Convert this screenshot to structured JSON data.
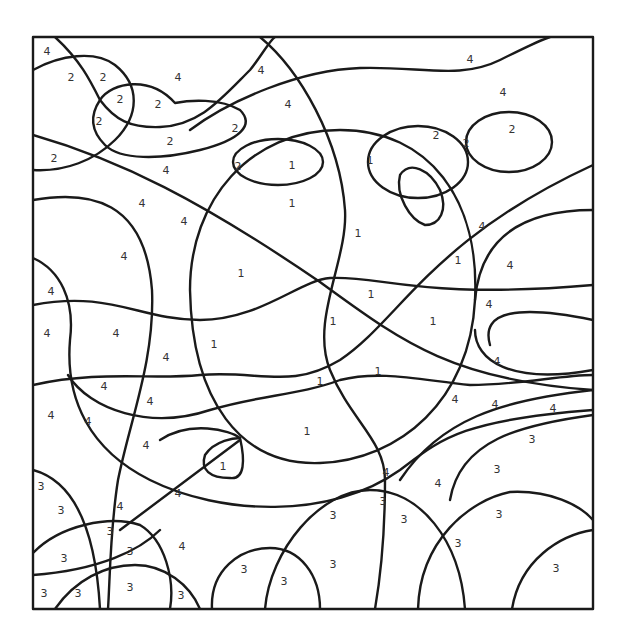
{
  "frame": {
    "x": 33,
    "y": 37,
    "width": 560,
    "height": 572
  },
  "colors": {
    "line": "#1a1a1a",
    "background": "#ffffff",
    "number": "#333333"
  },
  "region_numbers": [
    {
      "n": "4",
      "x": 47,
      "y": 52
    },
    {
      "n": "2",
      "x": 71,
      "y": 78
    },
    {
      "n": "2",
      "x": 103,
      "y": 78
    },
    {
      "n": "4",
      "x": 178,
      "y": 78
    },
    {
      "n": "4",
      "x": 261,
      "y": 71
    },
    {
      "n": "4",
      "x": 470,
      "y": 60
    },
    {
      "n": "2",
      "x": 120,
      "y": 100
    },
    {
      "n": "2",
      "x": 158,
      "y": 105
    },
    {
      "n": "2",
      "x": 99,
      "y": 122
    },
    {
      "n": "4",
      "x": 288,
      "y": 105
    },
    {
      "n": "4",
      "x": 503,
      "y": 93
    },
    {
      "n": "2",
      "x": 235,
      "y": 129
    },
    {
      "n": "2",
      "x": 170,
      "y": 142
    },
    {
      "n": "2",
      "x": 436,
      "y": 136
    },
    {
      "n": "2",
      "x": 466,
      "y": 144
    },
    {
      "n": "2",
      "x": 512,
      "y": 130
    },
    {
      "n": "2",
      "x": 54,
      "y": 159
    },
    {
      "n": "2",
      "x": 238,
      "y": 167
    },
    {
      "n": "1",
      "x": 292,
      "y": 166
    },
    {
      "n": "1",
      "x": 370,
      "y": 161
    },
    {
      "n": "4",
      "x": 166,
      "y": 171
    },
    {
      "n": "1",
      "x": 292,
      "y": 204
    },
    {
      "n": "4",
      "x": 142,
      "y": 204
    },
    {
      "n": "4",
      "x": 184,
      "y": 222
    },
    {
      "n": "1",
      "x": 358,
      "y": 234
    },
    {
      "n": "4",
      "x": 482,
      "y": 227
    },
    {
      "n": "4",
      "x": 124,
      "y": 257
    },
    {
      "n": "1",
      "x": 458,
      "y": 261
    },
    {
      "n": "4",
      "x": 510,
      "y": 266
    },
    {
      "n": "1",
      "x": 241,
      "y": 274
    },
    {
      "n": "4",
      "x": 51,
      "y": 292
    },
    {
      "n": "1",
      "x": 371,
      "y": 295
    },
    {
      "n": "4",
      "x": 489,
      "y": 305
    },
    {
      "n": "4",
      "x": 47,
      "y": 334
    },
    {
      "n": "4",
      "x": 116,
      "y": 334
    },
    {
      "n": "1",
      "x": 333,
      "y": 322
    },
    {
      "n": "1",
      "x": 433,
      "y": 322
    },
    {
      "n": "1",
      "x": 214,
      "y": 345
    },
    {
      "n": "4",
      "x": 166,
      "y": 358
    },
    {
      "n": "4",
      "x": 497,
      "y": 362
    },
    {
      "n": "1",
      "x": 378,
      "y": 372
    },
    {
      "n": "1",
      "x": 320,
      "y": 382
    },
    {
      "n": "4",
      "x": 104,
      "y": 387
    },
    {
      "n": "4",
      "x": 150,
      "y": 402
    },
    {
      "n": "4",
      "x": 455,
      "y": 400
    },
    {
      "n": "4",
      "x": 495,
      "y": 405
    },
    {
      "n": "4",
      "x": 553,
      "y": 409
    },
    {
      "n": "4",
      "x": 51,
      "y": 416
    },
    {
      "n": "4",
      "x": 88,
      "y": 422
    },
    {
      "n": "1",
      "x": 307,
      "y": 432
    },
    {
      "n": "3",
      "x": 532,
      "y": 440
    },
    {
      "n": "4",
      "x": 146,
      "y": 446
    },
    {
      "n": "1",
      "x": 223,
      "y": 467
    },
    {
      "n": "3",
      "x": 497,
      "y": 470
    },
    {
      "n": "4",
      "x": 386,
      "y": 473
    },
    {
      "n": "4",
      "x": 438,
      "y": 484
    },
    {
      "n": "3",
      "x": 41,
      "y": 487
    },
    {
      "n": "4",
      "x": 178,
      "y": 494
    },
    {
      "n": "3",
      "x": 383,
      "y": 502
    },
    {
      "n": "3",
      "x": 61,
      "y": 511
    },
    {
      "n": "4",
      "x": 120,
      "y": 507
    },
    {
      "n": "3",
      "x": 333,
      "y": 516
    },
    {
      "n": "3",
      "x": 404,
      "y": 520
    },
    {
      "n": "3",
      "x": 499,
      "y": 515
    },
    {
      "n": "3",
      "x": 110,
      "y": 532
    },
    {
      "n": "3",
      "x": 458,
      "y": 544
    },
    {
      "n": "4",
      "x": 182,
      "y": 547
    },
    {
      "n": "3",
      "x": 130,
      "y": 552
    },
    {
      "n": "3",
      "x": 64,
      "y": 559
    },
    {
      "n": "3",
      "x": 333,
      "y": 565
    },
    {
      "n": "3",
      "x": 556,
      "y": 569
    },
    {
      "n": "3",
      "x": 244,
      "y": 570
    },
    {
      "n": "3",
      "x": 284,
      "y": 582
    },
    {
      "n": "3",
      "x": 44,
      "y": 594
    },
    {
      "n": "3",
      "x": 78,
      "y": 594
    },
    {
      "n": "3",
      "x": 130,
      "y": 588
    },
    {
      "n": "3",
      "x": 181,
      "y": 596
    }
  ]
}
